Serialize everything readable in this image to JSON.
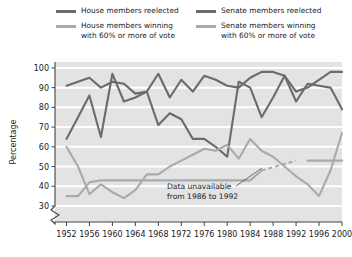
{
  "legend": {
    "entries": [
      {
        "label": "House members reelected",
        "color": "#6b6b6b",
        "column": "left"
      },
      {
        "label": "House members winning\nwith 60% or more of vote",
        "color": "#aaaaaa",
        "column": "left"
      },
      {
        "label": "Senate members reelected",
        "color": "#6b6b6b",
        "column": "right"
      },
      {
        "label": "Senate members winning\nwith 60% or more of vote",
        "color": "#aaaaaa",
        "column": "right"
      }
    ]
  },
  "annotation": {
    "line1": "Data unavailable",
    "line2": "from 1986 to 1992"
  },
  "chart_data": {
    "type": "line",
    "title": "",
    "xlabel": "",
    "ylabel": "Percentage",
    "xlim": [
      1950,
      2000
    ],
    "ylim": [
      28,
      103
    ],
    "grid": true,
    "axis_break_below": 30,
    "legend_position": "top",
    "plot_background": "#e3e3e3",
    "gridline_color": "#ffffff",
    "xticks": [
      1952,
      1956,
      1960,
      1964,
      1968,
      1972,
      1976,
      1980,
      1984,
      1988,
      1992,
      1996,
      2000
    ],
    "xtick_labels": [
      "1952",
      "1956",
      "1960",
      "1964",
      "1968",
      "1972",
      "1976",
      "1980",
      "1984",
      "1988",
      "1992",
      "1996",
      "2000"
    ],
    "yticks": [
      30,
      40,
      50,
      60,
      70,
      80,
      90,
      100
    ],
    "ytick_labels": [
      "30",
      "40",
      "50",
      "60",
      "70",
      "80",
      "90",
      "100"
    ],
    "x": [
      1952,
      1954,
      1956,
      1958,
      1960,
      1962,
      1964,
      1966,
      1968,
      1970,
      1972,
      1974,
      1976,
      1978,
      1980,
      1982,
      1984,
      1986,
      1988,
      1990,
      1992,
      1994,
      1996,
      1998,
      2000
    ],
    "series": [
      {
        "name": "House members reelected",
        "color": "#6b6b6b",
        "values": [
          91,
          93,
          95,
          90,
          93,
          92,
          87,
          88,
          97,
          85,
          94,
          88,
          96,
          94,
          91,
          90,
          95,
          98,
          98,
          96,
          88,
          90,
          94,
          98,
          98
        ]
      },
      {
        "name": "Senate members reelected",
        "color": "#6b6b6b",
        "values": [
          64,
          75,
          86,
          65,
          97,
          83,
          85,
          88,
          71,
          77,
          74,
          64,
          64,
          60,
          55,
          93,
          90,
          75,
          85,
          96,
          83,
          92,
          91,
          90,
          79
        ]
      },
      {
        "name": "House members winning with 60% or more of vote",
        "color": "#aaaaaa",
        "values": [
          35,
          35,
          42,
          43,
          43,
          43,
          43,
          43,
          43,
          43,
          43,
          43,
          43,
          43,
          43,
          43,
          43,
          48,
          null,
          null,
          null,
          53,
          53,
          53,
          53
        ]
      },
      {
        "name": "Senate members winning with 60% or more of vote",
        "color": "#aaaaaa",
        "values": [
          60,
          50,
          36,
          41,
          37,
          34,
          38,
          46,
          46,
          50,
          53,
          56,
          59,
          58,
          61,
          54,
          64,
          58,
          55,
          50,
          45,
          41,
          35,
          48,
          67
        ]
      }
    ],
    "dashed_gap": {
      "series": "House members winning with 60% or more of vote",
      "from_x": 1986,
      "to_x": 1992,
      "from_y": 48,
      "to_y": 53
    }
  }
}
